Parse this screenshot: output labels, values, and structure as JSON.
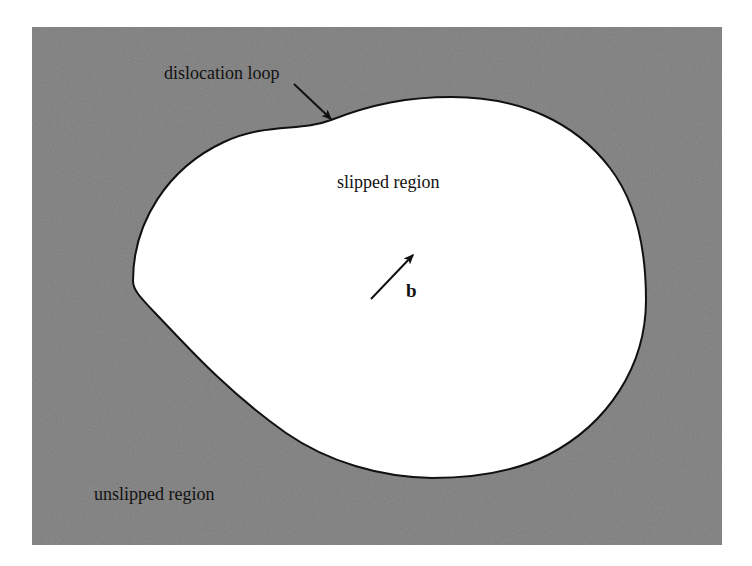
{
  "figure": {
    "domain": "diagram",
    "canvas": {
      "width": 752,
      "height": 566,
      "background": "#ffffff"
    },
    "panel": {
      "name": "slip-plane-panel",
      "x": 32,
      "y": 27,
      "width": 690,
      "height": 518,
      "fill": "#808080",
      "description": "uniform medium-gray rectangle representing the unslipped slip plane"
    },
    "loop": {
      "name": "dislocation-loop",
      "fill": "#ffffff",
      "stroke": "#111111",
      "stroke_width": 2,
      "description": "closed smooth kidney-shaped curve; interior is the slipped region",
      "extremes": {
        "leftmost": [
          133,
          281
        ],
        "topmost": [
          452,
          97
        ],
        "rightmost": [
          646,
          300
        ],
        "bottommost": [
          432,
          478
        ],
        "inflection_top_left": [
          331,
          120
        ]
      },
      "path": "M 133 281 C 133 222 168 168 224 142 C 268 122 300 132 331 120 C 372 104 408 97 452 97 C 520 97 575 122 610 168 C 636 202 646 250 646 300 C 646 366 608 424 548 455 C 512 473 470 478 432 478 C 380 477 328 462 286 433 C 226 391 183 342 157 315 C 140 297 133 290 133 281 Z"
    }
  },
  "labels": {
    "dislocation_loop": "dislocation loop",
    "slipped_region": "slipped region",
    "unslipped_region": "unslipped region",
    "burgers_vector": "b"
  },
  "annotations": {
    "loop_pointer": {
      "name": "dislocation-loop-pointer-arrow",
      "from": [
        294,
        84
      ],
      "to": [
        331,
        119
      ],
      "stroke": "#111111",
      "stroke_width": 2,
      "head": "solid-filled-triangle"
    },
    "burgers_arrow": {
      "name": "burgers-vector-arrow",
      "from": [
        371,
        299
      ],
      "to": [
        413,
        255
      ],
      "stroke": "#111111",
      "stroke_width": 2,
      "head": "solid-filled-triangle"
    }
  },
  "colors": {
    "panel_gray": "#808080",
    "ink_black": "#111111",
    "slipped_white": "#ffffff",
    "page_white": "#ffffff"
  }
}
